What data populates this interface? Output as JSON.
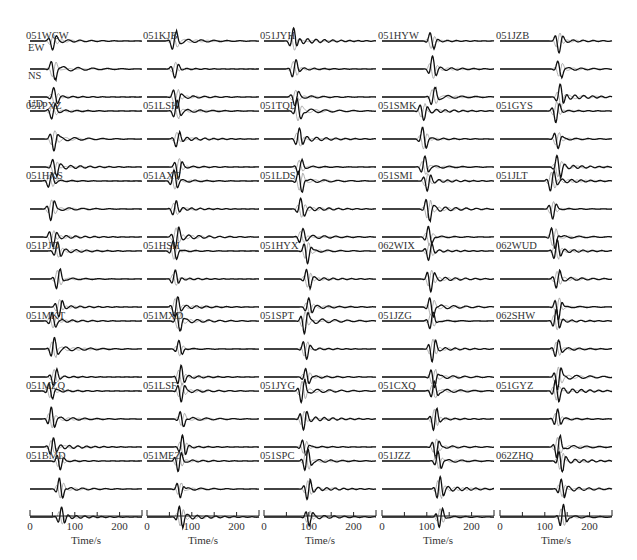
{
  "chart_data": {
    "type": "line",
    "title": "",
    "components": [
      "EW",
      "NS",
      "UD"
    ],
    "xlabel": "Time/s",
    "xlim": [
      0,
      250
    ],
    "xticks": [
      0,
      50,
      100,
      150,
      200,
      250
    ],
    "xtick_labels": [
      "0",
      "100",
      "200"
    ],
    "xtick_label_values": [
      0,
      100,
      200
    ],
    "grid": false,
    "rows": 7,
    "cols": 5,
    "stations": [
      {
        "name": "051WCW",
        "arrival": 45
      },
      {
        "name": "051KJB",
        "arrival": 55
      },
      {
        "name": "051JYH",
        "arrival": 60
      },
      {
        "name": "051HYW",
        "arrival": 105
      },
      {
        "name": "051JZB",
        "arrival": 125
      },
      {
        "name": "051PXZ",
        "arrival": 45
      },
      {
        "name": "051LSH",
        "arrival": 60
      },
      {
        "name": "051TQL",
        "arrival": 70
      },
      {
        "name": "051SMK",
        "arrival": 85
      },
      {
        "name": "051GYS",
        "arrival": 120
      },
      {
        "name": "051HXS",
        "arrival": 40
      },
      {
        "name": "051AXT",
        "arrival": 55
      },
      {
        "name": "051LDS",
        "arrival": 75
      },
      {
        "name": "051SMI",
        "arrival": 95
      },
      {
        "name": "051JLT",
        "arrival": 110
      },
      {
        "name": "051PJD",
        "arrival": 55
      },
      {
        "name": "051HSH",
        "arrival": 55
      },
      {
        "name": "051HYX",
        "arrival": 90
      },
      {
        "name": "062WIX",
        "arrival": 100
      },
      {
        "name": "062WUD",
        "arrival": 120
      },
      {
        "name": "051MKT",
        "arrival": 45
      },
      {
        "name": "051MXD",
        "arrival": 65
      },
      {
        "name": "051SPT",
        "arrival": 85
      },
      {
        "name": "051JZG",
        "arrival": 105
      },
      {
        "name": "062SHW",
        "arrival": 120
      },
      {
        "name": "051MZQ",
        "arrival": 40
      },
      {
        "name": "051LSF",
        "arrival": 70
      },
      {
        "name": "051JYG",
        "arrival": 80
      },
      {
        "name": "051CXQ",
        "arrival": 110
      },
      {
        "name": "051GYZ",
        "arrival": 120
      },
      {
        "name": "051BMD",
        "arrival": 60
      },
      {
        "name": "051MEZ",
        "arrival": 65
      },
      {
        "name": "051SPC",
        "arrival": 90
      },
      {
        "name": "051JZZ",
        "arrival": 120
      },
      {
        "name": "062ZHQ",
        "arrival": 130
      }
    ],
    "series": [
      {
        "name": "observed",
        "color": "#111111"
      },
      {
        "name": "synthetic",
        "color": "#999999"
      }
    ]
  }
}
